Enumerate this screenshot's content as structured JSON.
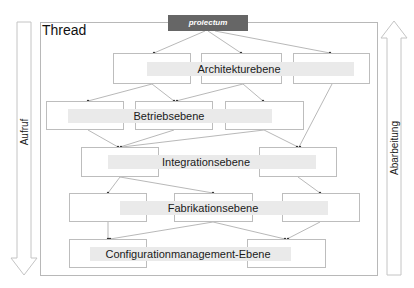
{
  "diagram": {
    "frame_title": "Thread",
    "top_node": "proiectum",
    "left_arrow": {
      "label": "Aufruf",
      "direction": "down"
    },
    "right_arrow": {
      "label": "Abarbeitung",
      "direction": "up"
    },
    "layers": [
      {
        "name": "Architekturebene",
        "box_count": 3
      },
      {
        "name": "Betriebsebene",
        "box_count": 3
      },
      {
        "name": "Integrationsebene",
        "box_count": 2
      },
      {
        "name": "Fabrikationsebene",
        "box_count": 3
      },
      {
        "name": "Configurationmanagement-Ebene",
        "box_count": 2
      }
    ]
  },
  "colors": {
    "top_node_bg": "#666666",
    "box_border": "#bdbdbd",
    "band": "#eaeaea",
    "line": "#9a9a9a"
  }
}
